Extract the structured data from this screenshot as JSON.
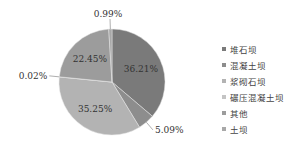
{
  "chart_data": {
    "type": "pie",
    "title": "",
    "slices": [
      {
        "label": "堆石坝",
        "value": 36.21,
        "display": "36.21%",
        "color": "#7a7a7a"
      },
      {
        "label": "混凝土坝",
        "value": 5.09,
        "display": "5.09%",
        "color": "#8d8d8d"
      },
      {
        "label": "浆砌石坝",
        "value": 35.25,
        "display": "35.25%",
        "color": "#b3b3b3"
      },
      {
        "label": "碾压混凝土坝",
        "value": 0.02,
        "display": "0.02%",
        "color": "#c4c4c4"
      },
      {
        "label": "其他",
        "value": 22.45,
        "display": "22.45%",
        "color": "#9c9c9c"
      },
      {
        "label": "土坝",
        "value": 0.99,
        "display": "0.99%",
        "color": "#a8a8a8"
      }
    ],
    "legend_position": "right",
    "start": "top",
    "direction": "clockwise"
  }
}
